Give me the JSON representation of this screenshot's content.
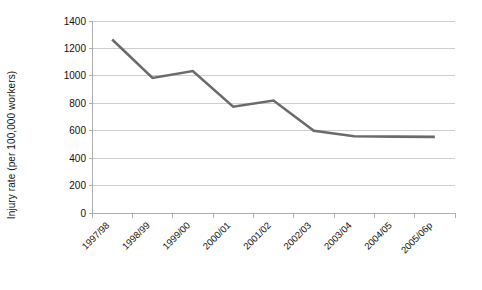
{
  "chart_data": {
    "type": "line",
    "title": "",
    "subtitle": "",
    "xlabel": "",
    "ylabel": "Injury rate (per 100,000 workers)",
    "categories": [
      "1997/98",
      "1998/99",
      "1999/00",
      "2000/01",
      "2001/02",
      "2002/03",
      "2003/04",
      "2004/05",
      "2005/06p"
    ],
    "values": [
      1265,
      985,
      1035,
      775,
      820,
      600,
      560,
      557,
      555
    ],
    "series": [
      {
        "name": "Injury rate",
        "values": [
          1265,
          985,
          1035,
          775,
          820,
          600,
          560,
          557,
          555
        ],
        "color": "#6b6b6b"
      }
    ],
    "ylim": [
      0,
      1400
    ],
    "ytick_step": 200,
    "yticks": [
      "0",
      "200",
      "400",
      "600",
      "800",
      "1000",
      "1200",
      "1400"
    ],
    "grid": "horizontal",
    "legend": "none",
    "xtick_rotation": -45,
    "line_color": "#6b6b6b",
    "gridline_color": "#b9b9b9",
    "axis_color": "#9a9a9a",
    "background": "#ffffff",
    "markers": "none"
  }
}
